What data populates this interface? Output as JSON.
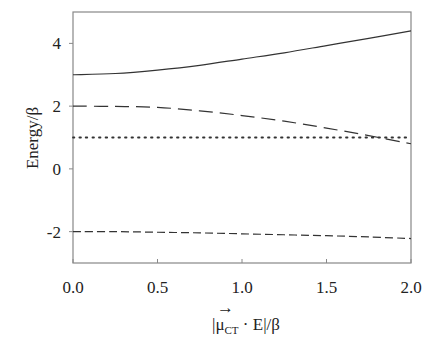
{
  "chart_data": {
    "type": "line",
    "title": "",
    "xlabel": "|μ_CT · E|/β",
    "xlabel_parts": {
      "abs_open": "|",
      "mu": "μ",
      "vec": "→",
      "sub": "CT",
      "dot_E": " · E",
      "abs_close": "|",
      "div": "/β"
    },
    "ylabel": "Energy/β",
    "xlim": [
      0.0,
      2.0
    ],
    "ylim": [
      -3,
      5
    ],
    "x_ticks": [
      0.0,
      0.5,
      1.0,
      1.5,
      2.0
    ],
    "x_tick_labels": [
      "0.0",
      "0.5",
      "1.0",
      "1.5",
      "2.0"
    ],
    "y_ticks": [
      -2,
      0,
      2,
      4
    ],
    "y_tick_labels": [
      "-2",
      "0",
      "2",
      "4"
    ],
    "grid": false,
    "legend": "none",
    "x": [
      0.0,
      0.25,
      0.5,
      0.75,
      1.0,
      1.25,
      1.5,
      1.75,
      2.0
    ],
    "series": [
      {
        "name": "upper-state",
        "style": "solid",
        "values": [
          3.0,
          3.04,
          3.15,
          3.3,
          3.5,
          3.7,
          3.93,
          4.16,
          4.4
        ]
      },
      {
        "name": "middle-state",
        "style": "long-dash",
        "values": [
          2.0,
          1.99,
          1.96,
          1.85,
          1.7,
          1.52,
          1.3,
          1.06,
          0.8
        ]
      },
      {
        "name": "flat-state",
        "style": "dotted",
        "values": [
          1.0,
          1.0,
          1.0,
          1.0,
          1.0,
          1.0,
          1.0,
          1.0,
          1.0
        ]
      },
      {
        "name": "lower-state",
        "style": "short-dash",
        "values": [
          -2.0,
          -2.0,
          -2.02,
          -2.04,
          -2.07,
          -2.1,
          -2.13,
          -2.17,
          -2.22
        ]
      }
    ]
  }
}
